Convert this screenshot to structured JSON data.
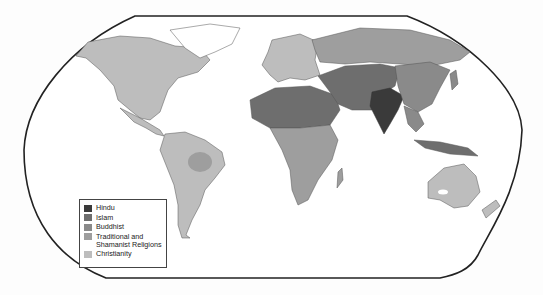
{
  "map": {
    "title": "",
    "projection": "Robinson-like world map",
    "legend": [
      {
        "label": "Hindu",
        "color": "#3a3a3a"
      },
      {
        "label": "Islam",
        "color": "#6e6e6e"
      },
      {
        "label": "Buddhist",
        "color": "#8a8a8a"
      },
      {
        "label": "Traditional and Shamanist Religions",
        "label_line1": "Traditional and",
        "label_line2": "Shamanist Religions",
        "color": "#9e9e9e"
      },
      {
        "label": "Christianity",
        "color": "#bdbdbd"
      }
    ],
    "colors": {
      "background": "#fdfdfd",
      "ocean": "#ffffff",
      "border": "#222222",
      "hindu": "#3a3a3a",
      "islam": "#6e6e6e",
      "buddhist": "#8a8a8a",
      "traditional": "#9e9e9e",
      "christianity": "#bdbdbd"
    }
  }
}
